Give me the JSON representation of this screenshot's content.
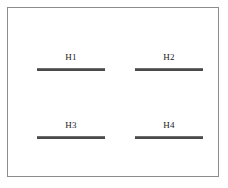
{
  "diagram": {
    "type": "hierarchy-level-bars",
    "background_color": "#ffffff",
    "frame": {
      "border_color": "#8c8c8c",
      "fill_color": "#ffffff"
    },
    "bar_color": "#4a4a4a",
    "label_color": "#1a1a1a",
    "items": [
      {
        "label": "H1",
        "row": 0,
        "column": 0
      },
      {
        "label": "H2",
        "row": 0,
        "column": 1
      },
      {
        "label": "H3",
        "row": 1,
        "column": 0
      },
      {
        "label": "H4",
        "row": 1,
        "column": 1
      }
    ]
  }
}
